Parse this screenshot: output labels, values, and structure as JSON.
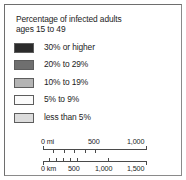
{
  "legend": {
    "title_line1": "Percentage of infected adults",
    "title_line2": "ages 15 to 49",
    "classes": [
      {
        "label": "30% or higher",
        "color": "#2b2b2b"
      },
      {
        "label": "20% to 29%",
        "color": "#6f6f6f"
      },
      {
        "label": "10% to 19%",
        "color": "#b4b4b4"
      },
      {
        "label": "5% to 9%",
        "color": "#fbfbfb"
      },
      {
        "label": "less than 5%",
        "color": "#dcdcdc"
      }
    ]
  },
  "scale_bar": {
    "miles": {
      "unit_label": "0 mi",
      "ticks": [
        "0",
        "100",
        "200",
        "300",
        "400",
        "500",
        "1,000"
      ],
      "labels": [
        {
          "text": "0 mi",
          "x": 0
        },
        {
          "text": "500",
          "x": 49
        },
        {
          "text": "1,000",
          "x": 92
        }
      ]
    },
    "kilometers": {
      "unit_label": "0 km",
      "labels": [
        {
          "text": "0 km",
          "x": 0
        },
        {
          "text": "500",
          "x": 27
        },
        {
          "text": "1,000",
          "x": 56
        },
        {
          "text": "1,500",
          "x": 89
        }
      ]
    }
  }
}
